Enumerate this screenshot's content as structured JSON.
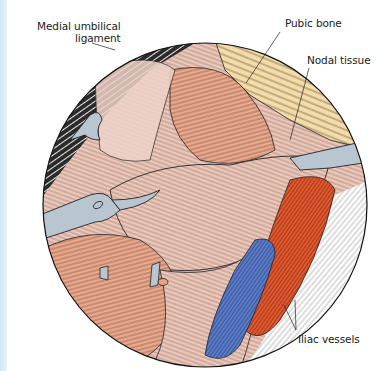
{
  "figure": {
    "labels": {
      "medial_umbilical_line1": "Medial umbilical",
      "medial_umbilical_line2": "ligament",
      "pubic_bone": "Pubic bone",
      "nodal_tissue": "Nodal tissue",
      "iliac_vessels": "Iliac vessels"
    },
    "colors": {
      "outline": "#1a1a1a",
      "peritoneum_dark": "#2a2a2a",
      "tissue_pink": "#e9c2b4",
      "tissue_light": "#efd3c8",
      "muscle_salmon": "#e9a88a",
      "bone": "#f3d9a6",
      "instrument": "#b8c4d0",
      "vein_blue": "#5577c4",
      "artery_red": "#e0532c",
      "side_strip": "#d6eaf7"
    }
  }
}
